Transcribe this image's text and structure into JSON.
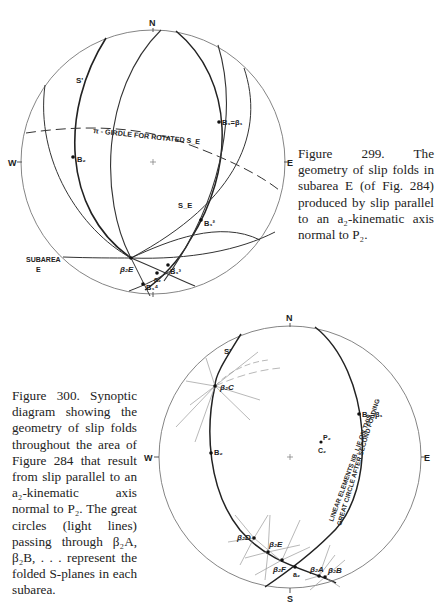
{
  "figure_299": {
    "caption": "Figure 299. The geometry of slip folds in subarea E (of Fig. 284) produced by slip parallel to an a₂-kinematic axis normal to P₂.",
    "compass": {
      "n": "N",
      "s": "S",
      "e": "E",
      "w": "W"
    },
    "labels": {
      "girdle": "π - GIRDLE FOR ROTATED S_E",
      "s_prime": "S'",
      "s_e": "S_E",
      "b2": "B₂",
      "b1_beta1": "B₁=β₁",
      "b1_2": "B₁²",
      "b1_3": "B₁³",
      "b1_4": "B₁⁴",
      "a2": "a₂",
      "beta2e": "β₂E",
      "subarea": "SUBAREA",
      "subarea_id": "E"
    }
  },
  "figure_300": {
    "caption": "Figure 300. Synoptic diagram showing the geometry of slip folds throughout the area of Figure 284 that result from slip parallel to an a₂-kinematic axis normal to P₂. The great circles (light lines) passing through β₂A, β₂B, . . . represent the folded S-planes in each subarea.",
    "compass": {
      "n": "N",
      "s": "S",
      "e": "E",
      "w": "W"
    },
    "labels": {
      "s_prime": "S'",
      "beta2c": "β₂C",
      "b2": "B₂",
      "p2": "P₂",
      "c2": "C₂",
      "b1_beta1": "B₁=β₁",
      "great_circle_line1": "LINEAR ELEMENTS IIB, LIE ON THIS",
      "great_circle_line2": "GREAT CIRCLE AFTER SECOND FOLDING",
      "beta2d": "β₂D",
      "beta2e": "β₂E",
      "beta2f": "β₂F",
      "a2": "a₂",
      "beta2a": "β₂A",
      "beta2b": "β₂B"
    }
  }
}
